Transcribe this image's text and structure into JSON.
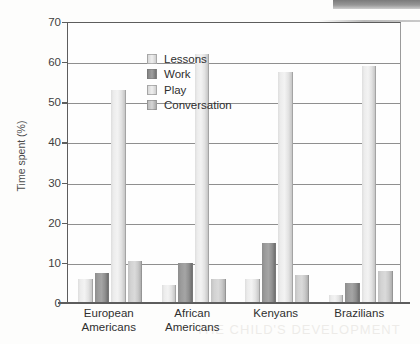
{
  "chart_data": {
    "type": "bar",
    "title": "",
    "xlabel": "",
    "ylabel": "Time spent (%)",
    "ylim": [
      0,
      70
    ],
    "ytick_step": 10,
    "yticks": [
      0,
      10,
      20,
      30,
      40,
      50,
      60,
      70
    ],
    "grid": true,
    "legend_position": "top-left inside plot",
    "categories": [
      "European Americans",
      "African Americans",
      "Kenyans",
      "Brazilians"
    ],
    "category_lines": [
      [
        "European",
        "Americans"
      ],
      [
        "African",
        "Americans"
      ],
      [
        "Kenyans",
        ""
      ],
      [
        "Brazilians",
        ""
      ]
    ],
    "series": [
      {
        "name": "Lessons",
        "color": "#ececec",
        "values": [
          6,
          4.5,
          6,
          2
        ]
      },
      {
        "name": "Work",
        "color": "#8f8f8f",
        "values": [
          7.5,
          10,
          15,
          5
        ]
      },
      {
        "name": "Play",
        "color": "#ececec",
        "values": [
          53,
          62,
          57.5,
          59
        ]
      },
      {
        "name": "Conversation",
        "color": "#d2d2d2",
        "values": [
          10.5,
          6,
          7,
          8
        ]
      }
    ]
  },
  "artifacts": {
    "ghost_text_bottom": "THE CHILD'S DEVELOPMENT",
    "ghost_text_middle": "Cultural Comparison"
  }
}
